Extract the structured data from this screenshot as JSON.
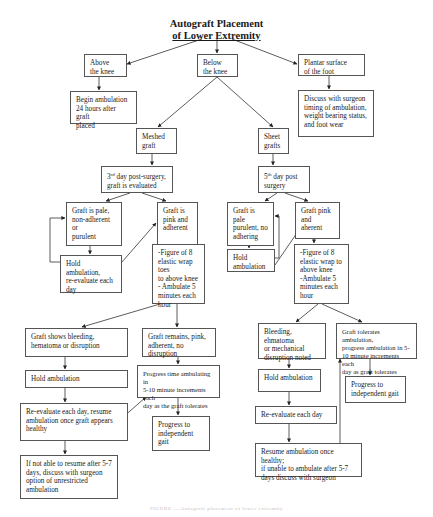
{
  "title": {
    "line1": "Autograft Placement",
    "line2": "of Lower Extremity"
  },
  "nodes": {
    "above_knee": "Above\nthe knee",
    "below_knee": "Below\nthe knee",
    "plantar": "Plantar surface\nof the foot",
    "begin_ambulation": "Begin ambulation\n24 hours after graft\nplaced",
    "discuss_surgeon": "Discuss with surgeon\ntiming of ambulation,\nweight bearing status,\nand foot wear",
    "meshed_graft": "Meshed\ngraft",
    "sheet_grafts": "Sheet\ngrafts",
    "day3_prefix": "3",
    "day3_sup": "rd",
    "day3_text": " day post-surgery,\ngraft is evaluated",
    "day5_prefix": "5",
    "day5_sup": "th",
    "day5_text": " day post\nsurgery",
    "mesh_pale": "Graft is pale,\nnon-adherent or\npurulent",
    "mesh_pink": "Graft is\npink and\nadherent",
    "sheet_pale": "Graft is pale\npurulent, no\nadhering",
    "sheet_pink": "Graft pink\nand aherent",
    "mesh_hold_reeval": "Hold ambulation,\nre-evaluate each\nday",
    "sheet_hold": "Hold\nambulation",
    "mesh_fig8": "-Figure of 8\nelastic wrap toes\nto above knee\n- Ambulate 5\nminutes each\nhour",
    "sheet_fig8": "-Figure of 8\nelastic wrap to\nabove knee\n-Ambulate 5\nminutes each\nhour",
    "mesh_bleeding": "Graft shows bleeding,\nhematoma or disruption",
    "mesh_remains": "Graft remains, pink,\nadherent, no disruption",
    "sheet_bleeding": "Bleeding, ehmatoma\nor mechanical\ndisruption noted",
    "sheet_tolerates": "Graft tolerates ambulation,\nprogress ambulation in 5-\n10 minute increments each\nday as graft tolerates",
    "mesh_hold2": "Hold ambulation",
    "mesh_progress_time": "Progress time ambulating in\n5-10 minute increments each\nday as the graft tolerates",
    "sheet_hold2": "Hold ambulation",
    "sheet_progress_gait": "Progress to\nindependent gait",
    "mesh_reeval_resume": "Re-evaluate each day, resume\nambulation once graft appears\nhealthy",
    "mesh_progress_gait": "Progress to\nindependent\ngait",
    "sheet_reeval": "Re-evaluate each day",
    "mesh_not_able": "If not able to resume after 5-7\ndays, discuss with surgeon\noption of unrestricted\nambulation",
    "sheet_resume": "Resume ambulation once healthy;\nif unable to ambulate after 5-7\ndays discuss with surgeon"
  },
  "caption": "FIGURE — Autograft placement of lower extremity"
}
